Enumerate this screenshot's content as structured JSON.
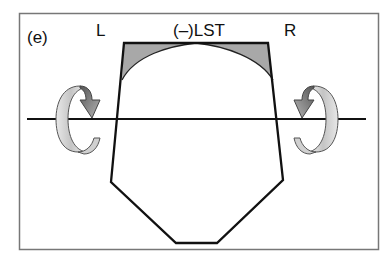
{
  "diagram": {
    "panel_label": "(e)",
    "labels": {
      "left": "L",
      "center": "(–)LST",
      "right": "R"
    },
    "elements": {
      "frame": "rectangular border",
      "shape": "heptagonal outline with shaded top corners",
      "axis": "horizontal rotation axis",
      "rotation_left": "curved rotation arrow (left side)",
      "rotation_right": "curved rotation arrow (right side)"
    },
    "colors": {
      "outline": "#111111",
      "shade": "#a8a8a8",
      "frame": "#777777",
      "arrow_light": "#d9d9d9",
      "arrow_dark": "#6e6e6e"
    }
  }
}
